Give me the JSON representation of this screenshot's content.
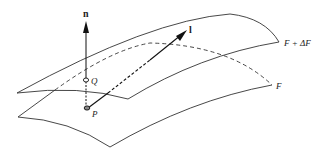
{
  "diagram": {
    "title": "",
    "labels": {
      "normal_vector": "n",
      "direction_vector": "l",
      "point_q": "Q",
      "point_p": "P",
      "surface_upper": "F + ΔF",
      "surface_lower": "F"
    },
    "elements": [
      {
        "id": "surface-upper",
        "type": "surface",
        "label": "F + ΔF"
      },
      {
        "id": "surface-lower",
        "type": "surface",
        "label": "F"
      },
      {
        "id": "normal-vector",
        "type": "arrow",
        "from": "P",
        "label": "n"
      },
      {
        "id": "direction-vector",
        "type": "arrow",
        "from": "P",
        "label": "l"
      },
      {
        "id": "point-p",
        "type": "point",
        "label": "P",
        "on": "F"
      },
      {
        "id": "point-q",
        "type": "point",
        "label": "Q",
        "on": "F + ΔF"
      }
    ],
    "colors": {
      "stroke": "#333333",
      "background": "#ffffff"
    }
  }
}
